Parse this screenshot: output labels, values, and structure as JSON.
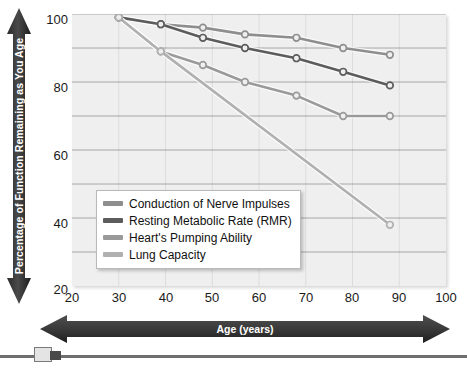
{
  "chart_data": {
    "type": "line",
    "title": "",
    "xlabel": "Age (years)",
    "ylabel": "Percentage of Function Remaining as You Age",
    "xlim": [
      20,
      100
    ],
    "ylim": [
      20,
      100
    ],
    "xticks": [
      20,
      30,
      40,
      50,
      60,
      70,
      80,
      90,
      100
    ],
    "yticks": [
      20,
      40,
      60,
      80,
      100
    ],
    "gridlines_y": [
      20,
      30,
      40,
      50,
      60,
      70,
      80,
      90,
      100
    ],
    "grid": true,
    "legend_position": "center-left-inside",
    "marker": "open-circle",
    "series": [
      {
        "name": "Conduction of Nerve Impulses",
        "color": "#8e8e8e",
        "x": [
          30,
          39,
          48,
          57,
          68,
          78,
          88
        ],
        "values": [
          99,
          97,
          96,
          94,
          93,
          90,
          88
        ]
      },
      {
        "name": "Resting Metabolic Rate (RMR)",
        "color": "#5c5c5c",
        "x": [
          30,
          39,
          48,
          57,
          68,
          78,
          88
        ],
        "values": [
          99,
          97,
          93,
          90,
          87,
          83,
          79
        ]
      },
      {
        "name": "Heart's Pumping Ability",
        "color": "#9a9a9a",
        "x": [
          30,
          39,
          48,
          57,
          68,
          78,
          88
        ],
        "values": [
          99,
          89,
          85,
          80,
          76,
          70,
          70
        ]
      },
      {
        "name": "Lung Capacity",
        "color": "#b0b0b0",
        "x": [
          30,
          39,
          88
        ],
        "values": [
          99,
          89,
          38
        ]
      }
    ]
  },
  "axes": {
    "y_arrow_label": "Percentage of Function Remaining as You Age",
    "x_arrow_label": "Age (years)",
    "y_tick_labels": [
      "100",
      "80",
      "60",
      "40",
      "20"
    ],
    "x_tick_labels": [
      "20",
      "30",
      "40",
      "50",
      "60",
      "70",
      "80",
      "90",
      "100"
    ]
  },
  "legend": {
    "entries": [
      {
        "label": "Conduction of Nerve Impulses",
        "color": "#8e8e8e"
      },
      {
        "label": "Resting Metabolic Rate (RMR)",
        "color": "#5c5c5c"
      },
      {
        "label": "Heart's Pumping Ability",
        "color": "#9a9a9a"
      },
      {
        "label": "Lung Capacity",
        "color": "#b0b0b0"
      }
    ]
  },
  "colors": {
    "plot_background": "#efefef",
    "gridline": "#6d6d6d",
    "minor_gridline": "#dcdcdc",
    "arrow_fill": "#3d3d3d",
    "tick_text": "#1a1a1a"
  }
}
